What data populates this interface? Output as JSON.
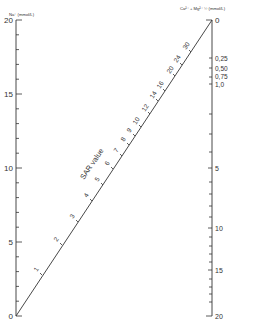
{
  "left_axis": {
    "title": "Na⁺ (mmol/L)",
    "major_labels": [
      "0",
      "5",
      "10",
      "15",
      "20"
    ]
  },
  "right_axis": {
    "title": "Ca²⁺ + Mg²⁺ ½ (mmol/L)",
    "labels": [
      "0",
      "0,25",
      "0,50",
      "0,75",
      "1,0",
      "5",
      "10",
      "15",
      "20"
    ]
  },
  "sar_line": {
    "title": "SAR value",
    "labels": [
      "1",
      "2",
      "3",
      "4",
      "5",
      "6",
      "7",
      "8",
      "9",
      "10",
      "12",
      "14",
      "16",
      "20",
      "24",
      "30"
    ]
  },
  "colors": {
    "line": "#333333",
    "background": "#ffffff"
  }
}
